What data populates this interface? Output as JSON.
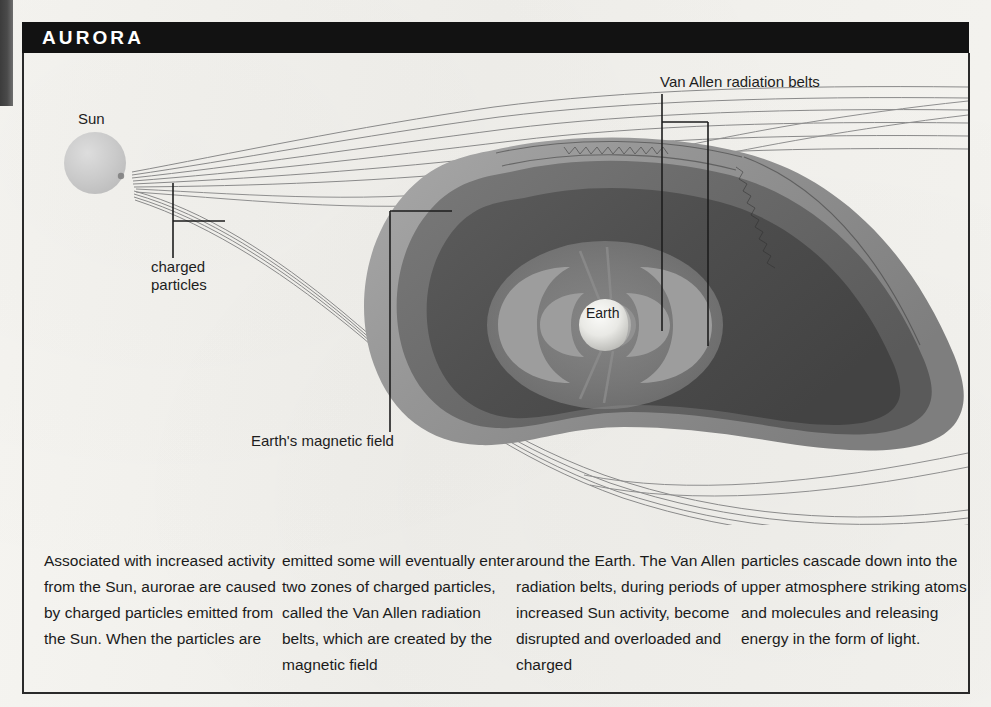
{
  "header": {
    "title": "AURORA"
  },
  "diagram": {
    "labels": {
      "sun": "Sun",
      "charged_particles": "charged\nparticles",
      "van_allen": "Van Allen radiation belts",
      "earth": "Earth",
      "magnetic_field": "Earth's magnetic field"
    },
    "colors": {
      "background": "#f3f2ee",
      "header_bar": "#121212",
      "sun_fill": "#c9c9c9",
      "earth_fill": "#ededea",
      "magnetosphere_outer": "#9a9a9a",
      "magnetosphere_mid": "#6d6d6d",
      "magnetosphere_inner": "#4f4f4f",
      "belt_lobe": "#8e8e8e",
      "streamline": "#7a7a7a",
      "leader_line": "#1d1d1d",
      "text": "#1b1b1b"
    }
  },
  "caption": {
    "columns": [
      "Associated with increased activity from the Sun, aurorae are caused by charged particles emitted from the Sun. When the particles are",
      "emitted some will eventually enter two zones of charged particles, called the Van Allen radiation belts, which are created by the magnetic field",
      "around the Earth. The Van Allen radiation belts, during periods of increased Sun activity, become disrupted and overloaded and charged",
      "particles cascade down into the upper atmosphere striking atoms and molecules and releasing energy in the form of light."
    ]
  }
}
